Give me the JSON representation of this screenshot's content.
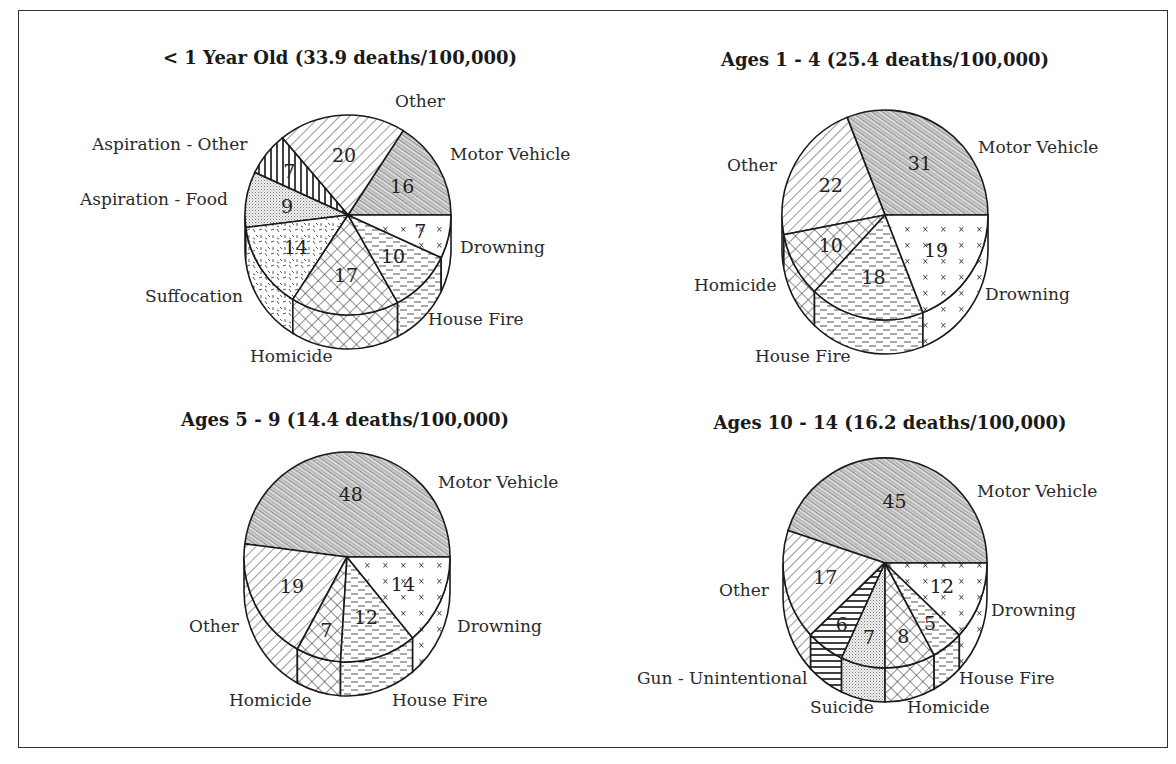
{
  "chart_data": [
    {
      "type": "pie",
      "title": "< 1 Year Old (33.9 deaths/100,000)",
      "categories": [
        "Motor Vehicle",
        "Other",
        "Aspiration - Other",
        "Aspiration - Food",
        "Suffocation",
        "Homicide",
        "House Fire",
        "Drowning"
      ],
      "values": [
        16,
        20,
        7,
        9,
        14,
        17,
        10,
        7
      ],
      "patterns": [
        "mv",
        "diag",
        "vert",
        "dots",
        "dash",
        "cross",
        "hdash",
        "xs"
      ]
    },
    {
      "type": "pie",
      "title": "Ages 1 - 4 (25.4 deaths/100,000)",
      "categories": [
        "Motor Vehicle",
        "Other",
        "Homicide",
        "House Fire",
        "Drowning"
      ],
      "values": [
        31,
        22,
        10,
        18,
        19
      ],
      "patterns": [
        "mv",
        "diag",
        "cross",
        "hdash",
        "xs"
      ]
    },
    {
      "type": "pie",
      "title": "Ages 5 - 9 (14.4 deaths/100,000)",
      "categories": [
        "Motor Vehicle",
        "Other",
        "Homicide",
        "House Fire",
        "Drowning"
      ],
      "values": [
        48,
        19,
        7,
        12,
        14
      ],
      "patterns": [
        "mv",
        "diag",
        "cross",
        "hdash",
        "xs"
      ]
    },
    {
      "type": "pie",
      "title": "Ages 10 - 14 (16.2 deaths/100,000)",
      "categories": [
        "Motor Vehicle",
        "Other",
        "Gun - Unintentional",
        "Suicide",
        "Homicide",
        "House Fire",
        "Drowning"
      ],
      "values": [
        45,
        17,
        6,
        7,
        8,
        5,
        12
      ],
      "patterns": [
        "mv",
        "diag",
        "hlines",
        "dots",
        "cross",
        "hdash",
        "xs"
      ]
    }
  ],
  "charts": [
    {
      "title": "< 1 Year Old (33.9 deaths/100,000)",
      "labels": [
        {
          "text": "Other",
          "x": 395,
          "y": 107
        },
        {
          "text": "Motor Vehicle",
          "x": 450,
          "y": 160
        },
        {
          "text": "Aspiration - Other",
          "x": 92,
          "y": 150
        },
        {
          "text": "Aspiration - Food",
          "x": 80,
          "y": 205
        },
        {
          "text": "Drowning",
          "x": 460,
          "y": 253
        },
        {
          "text": "Suffocation",
          "x": 145,
          "y": 302
        },
        {
          "text": "House Fire",
          "x": 428,
          "y": 325
        },
        {
          "text": "Homicide",
          "x": 250,
          "y": 362
        }
      ]
    },
    {
      "title": "Ages 1 - 4 (25.4 deaths/100,000)",
      "labels": [
        {
          "text": "Motor Vehicle",
          "x": 978,
          "y": 153
        },
        {
          "text": "Other",
          "x": 727,
          "y": 171
        },
        {
          "text": "Homicide",
          "x": 694,
          "y": 291
        },
        {
          "text": "Drowning",
          "x": 985,
          "y": 300
        },
        {
          "text": "House Fire",
          "x": 755,
          "y": 362
        }
      ]
    },
    {
      "title": "Ages 5 - 9 (14.4 deaths/100,000)",
      "labels": [
        {
          "text": "Motor Vehicle",
          "x": 438,
          "y": 488
        },
        {
          "text": "Other",
          "x": 189,
          "y": 632
        },
        {
          "text": "Drowning",
          "x": 457,
          "y": 632
        },
        {
          "text": "Homicide",
          "x": 229,
          "y": 706
        },
        {
          "text": "House Fire",
          "x": 392,
          "y": 706
        }
      ]
    },
    {
      "title": "Ages 10 - 14 (16.2 deaths/100,000)",
      "labels": [
        {
          "text": "Motor Vehicle",
          "x": 977,
          "y": 497
        },
        {
          "text": "Other",
          "x": 719,
          "y": 596
        },
        {
          "text": "Drowning",
          "x": 991,
          "y": 616
        },
        {
          "text": "Gun - Unintentional",
          "x": 637,
          "y": 684
        },
        {
          "text": "House Fire",
          "x": 959,
          "y": 684
        },
        {
          "text": "Suicide",
          "x": 810,
          "y": 713
        },
        {
          "text": "Homicide",
          "x": 907,
          "y": 713
        }
      ]
    }
  ],
  "colors": {
    "stroke": "#1a1a1a",
    "background": "#ffffff"
  }
}
